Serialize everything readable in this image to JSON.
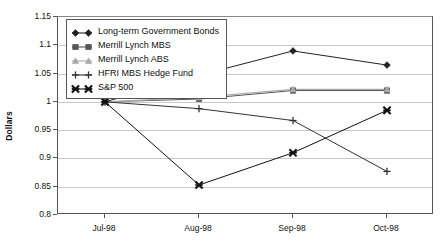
{
  "chart_data": {
    "type": "line",
    "title": "",
    "xlabel": "",
    "ylabel": "Dollars",
    "categories": [
      "Jul-98",
      "Aug-98",
      "Sep-98",
      "Oct-98"
    ],
    "ylim": [
      0.8,
      1.15
    ],
    "ytick_step": 0.05,
    "ytick_labels": [
      "1.15",
      "1.1",
      "1.05",
      "1",
      "0.95",
      "0.9",
      "0.85",
      "0.8"
    ],
    "ytick_values": [
      1.15,
      1.1,
      1.05,
      1.0,
      0.95,
      0.9,
      0.85,
      0.8
    ],
    "grid": "horizontal",
    "legend_position": "upper-left-inside",
    "series": [
      {
        "name": "Long-term Government Bonds",
        "values": [
          1.0,
          1.047,
          1.09,
          1.065
        ],
        "marker": "diamond",
        "color": "#222222"
      },
      {
        "name": "Merrill Lynch MBS",
        "values": [
          1.0,
          1.005,
          1.02,
          1.02
        ],
        "marker": "square",
        "color": "#555555"
      },
      {
        "name": "Merrill Lynch ABS",
        "values": [
          1.0,
          1.008,
          1.022,
          1.022
        ],
        "marker": "triangle",
        "color": "#aaaaaa"
      },
      {
        "name": "HFRI MBS Hedge Fund",
        "values": [
          1.0,
          0.988,
          0.967,
          0.877
        ],
        "marker": "plus",
        "color": "#333333"
      },
      {
        "name": "S&P 500",
        "values": [
          1.0,
          0.853,
          0.91,
          0.985
        ],
        "marker": "cross-bold",
        "color": "#111111"
      }
    ]
  }
}
